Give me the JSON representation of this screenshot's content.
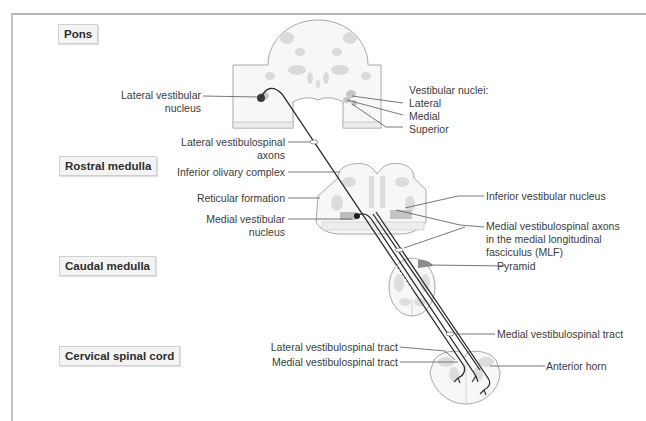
{
  "levels": {
    "pons": "Pons",
    "rostral_medulla": "Rostral medulla",
    "caudal_medulla": "Caudal medulla",
    "cervical_spinal_cord": "Cervical spinal cord"
  },
  "labels_left": {
    "lateral_vestibular_nucleus_1": "Lateral vestibular",
    "lateral_vestibular_nucleus_2": "nucleus",
    "lateral_vestibulospinal_axons_1": "Lateral vestibulospinal",
    "lateral_vestibulospinal_axons_2": "axons",
    "inferior_olivary_complex": "Inferior olivary complex",
    "reticular_formation": "Reticular formation",
    "medial_vestibular_nucleus_1": "Medial vestibular",
    "medial_vestibular_nucleus_2": "nucleus",
    "lateral_vestibulospinal_tract": "Lateral vestibulospinal tract",
    "medial_vestibulospinal_tract": "Medial vestibulospinal tract"
  },
  "labels_right": {
    "vestibular_nuclei_header": "Vestibular nuclei:",
    "vn_lateral": "Lateral",
    "vn_medial": "Medial",
    "vn_superior": "Superior",
    "inferior_vestibular_nucleus": "Inferior vestibular nucleus",
    "mlf_1": "Medial vestibulospinal axons",
    "mlf_2": "in the medial longitudinal",
    "mlf_3": "fasciculus (MLF)",
    "pyramid": "Pyramid",
    "medial_vestibulospinal_tract": "Medial vestibulospinal tract",
    "anterior_horn": "Anterior horn"
  },
  "colors": {
    "tissue_fill": "#f7f7f7",
    "tissue_stroke": "#a8a8a8",
    "gray_matter": "#d8d8d8",
    "nucleus_dark": "#9a9a9a",
    "pyramid_fill": "#8c8c8c",
    "axon": "#2a2a2a",
    "leader": "#555555"
  }
}
